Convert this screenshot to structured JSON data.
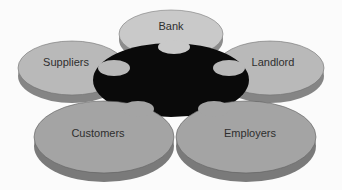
{
  "diagram": {
    "type": "puzzle-flower",
    "center": {
      "label": "",
      "color": "#0a0a0a"
    },
    "petals": [
      {
        "id": "bank",
        "label": "Bank",
        "top_color": "#c9c9c9",
        "side_color": "#8c8c8c"
      },
      {
        "id": "suppliers",
        "label": "Suppliers",
        "top_color": "#b9b9b9",
        "side_color": "#858585"
      },
      {
        "id": "landlord",
        "label": "Landlord",
        "top_color": "#b9b9b9",
        "side_color": "#858585"
      },
      {
        "id": "customers",
        "label": "Customers",
        "top_color": "#a4a4a4",
        "side_color": "#7a7a7a"
      },
      {
        "id": "employers",
        "label": "Employers",
        "top_color": "#a4a4a4",
        "side_color": "#7a7a7a"
      }
    ]
  }
}
